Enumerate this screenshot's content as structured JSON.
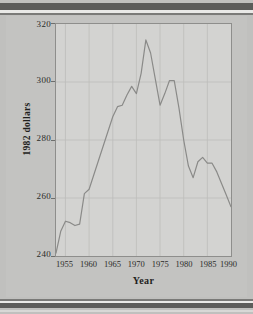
{
  "page": {
    "background_color": "#c0c0be",
    "rule_color": "#5c5c5a"
  },
  "chart_data": {
    "type": "line",
    "title": "",
    "subtitle": "",
    "xlabel": "Year",
    "ylabel": "1982 dollars",
    "xlim": [
      1953,
      1990
    ],
    "ylim": [
      240,
      320
    ],
    "grid": true,
    "legend": null,
    "legend_position": "none",
    "line_color": "#8a8a88",
    "plot_background": "#d3d3d1",
    "xticks": [
      1955,
      1960,
      1965,
      1970,
      1975,
      1980,
      1985,
      1990
    ],
    "xtick_labels": [
      "1955",
      "1960",
      "1965",
      "1970",
      "1975",
      "1980",
      "1985",
      "1990"
    ],
    "yticks": [
      240,
      260,
      280,
      300,
      320
    ],
    "ytick_labels": [
      "240",
      "260",
      "280",
      "300",
      "320"
    ],
    "series": [
      {
        "name": "Real weekly earnings",
        "x": [
          1953,
          1954,
          1955,
          1956,
          1957,
          1958,
          1959,
          1960,
          1961,
          1962,
          1963,
          1964,
          1965,
          1966,
          1967,
          1968,
          1969,
          1970,
          1971,
          1972,
          1973,
          1974,
          1975,
          1976,
          1977,
          1978,
          1979,
          1980,
          1981,
          1982,
          1983,
          1984,
          1985,
          1986,
          1987,
          1988,
          1989,
          1990
        ],
        "y": [
          241.0,
          248.5,
          252.0,
          251.5,
          250.5,
          251.0,
          261.5,
          263.0,
          268.0,
          273.0,
          278.0,
          283.0,
          288.0,
          291.5,
          292.0,
          295.5,
          298.5,
          296.0,
          303.0,
          314.5,
          310.0,
          301.0,
          292.0,
          296.0,
          300.5,
          300.5,
          291.0,
          280.0,
          271.0,
          267.0,
          272.5,
          274.0,
          272.0,
          272.0,
          269.0,
          265.0,
          261.0,
          257.0
        ]
      }
    ]
  },
  "axis": {
    "y_title": "1982 dollars",
    "x_title": "Year"
  }
}
